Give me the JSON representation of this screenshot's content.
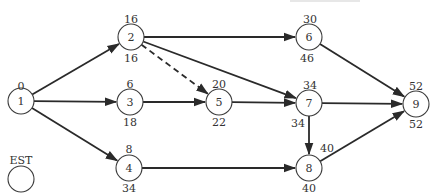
{
  "diagram": {
    "type": "activity-network",
    "legend": {
      "label": "EST",
      "x": 21,
      "y": 179,
      "label_y": 160
    },
    "nodes": [
      {
        "id": "1",
        "x": 21,
        "y": 101,
        "est": "0",
        "lst": "",
        "est_pos": [
          21,
          86
        ],
        "lst_pos": null
      },
      {
        "id": "2",
        "x": 131,
        "y": 37,
        "est": "16",
        "lst": "16",
        "est_pos": [
          131,
          19
        ],
        "lst_pos": [
          131,
          58
        ]
      },
      {
        "id": "3",
        "x": 130,
        "y": 102,
        "est": "6",
        "lst": "18",
        "est_pos": [
          130,
          84
        ],
        "lst_pos": [
          130,
          122
        ]
      },
      {
        "id": "4",
        "x": 129,
        "y": 168,
        "est": "8",
        "lst": "34",
        "est_pos": [
          129,
          149
        ],
        "lst_pos": [
          129,
          188
        ]
      },
      {
        "id": "5",
        "x": 219,
        "y": 102,
        "est": "20",
        "lst": "22",
        "est_pos": [
          219,
          84
        ],
        "lst_pos": [
          219,
          122
        ]
      },
      {
        "id": "6",
        "x": 309,
        "y": 37,
        "est": "30",
        "lst": "46",
        "est_pos": [
          310,
          19
        ],
        "lst_pos": [
          307,
          58
        ]
      },
      {
        "id": "7",
        "x": 309,
        "y": 103,
        "est": "34",
        "lst": "34",
        "est_pos": [
          310,
          85
        ],
        "lst_pos": [
          298,
          123
        ]
      },
      {
        "id": "8",
        "x": 309,
        "y": 168,
        "est": "40",
        "lst": "40",
        "est_pos": [
          327,
          148
        ],
        "lst_pos": [
          309,
          188
        ]
      },
      {
        "id": "9",
        "x": 416,
        "y": 104,
        "est": "52",
        "lst": "52",
        "est_pos": [
          416,
          86
        ],
        "lst_pos": [
          416,
          124
        ]
      }
    ],
    "edges": [
      {
        "from": "1",
        "to": "2",
        "style": "solid"
      },
      {
        "from": "1",
        "to": "3",
        "style": "solid"
      },
      {
        "from": "1",
        "to": "4",
        "style": "solid"
      },
      {
        "from": "2",
        "to": "6",
        "style": "solid"
      },
      {
        "from": "2",
        "to": "7",
        "style": "solid"
      },
      {
        "from": "2",
        "to": "5",
        "style": "dashed"
      },
      {
        "from": "3",
        "to": "5",
        "style": "solid"
      },
      {
        "from": "5",
        "to": "7",
        "style": "solid"
      },
      {
        "from": "4",
        "to": "8",
        "style": "solid"
      },
      {
        "from": "6",
        "to": "9",
        "style": "solid"
      },
      {
        "from": "7",
        "to": "9",
        "style": "solid"
      },
      {
        "from": "7",
        "to": "8",
        "style": "solid"
      },
      {
        "from": "8",
        "to": "9",
        "style": "solid"
      }
    ],
    "node_radius": 13,
    "colors": {
      "stroke": "#2a2a2a",
      "text": "#333333",
      "background": "#ffffff"
    }
  }
}
